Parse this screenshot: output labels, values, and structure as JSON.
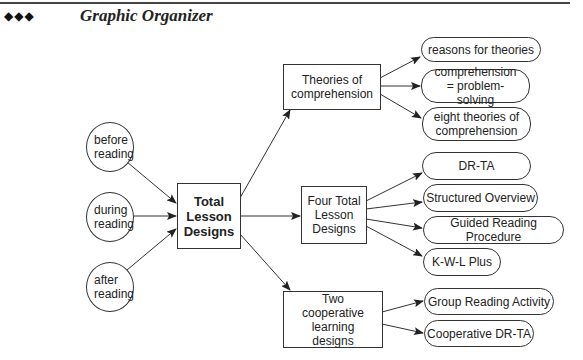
{
  "header": {
    "bullets": "◆◆◆",
    "title": "Graphic Organizer"
  },
  "diagram": {
    "inputs": [
      {
        "id": "before",
        "label": "before reading"
      },
      {
        "id": "during",
        "label": "during reading"
      },
      {
        "id": "after",
        "label": "after reading"
      }
    ],
    "center": {
      "id": "total",
      "label": "Total Lesson Designs"
    },
    "branches": [
      {
        "id": "theories",
        "label": "Theories of comprehension",
        "children": [
          "reasons for theories",
          "comprehension = problem-solving",
          "eight theories of comprehension"
        ]
      },
      {
        "id": "four",
        "label": "Four Total Lesson Designs",
        "children": [
          "DR-TA",
          "Structured Overview",
          "Guided Reading Procedure",
          "K-W-L Plus"
        ]
      },
      {
        "id": "two",
        "label": "Two cooperative learning designs",
        "children": [
          "Group Reading Activity",
          "Cooperative DR-TA"
        ]
      }
    ],
    "colors": {
      "line": "#333333",
      "background": "#ffffff"
    }
  }
}
